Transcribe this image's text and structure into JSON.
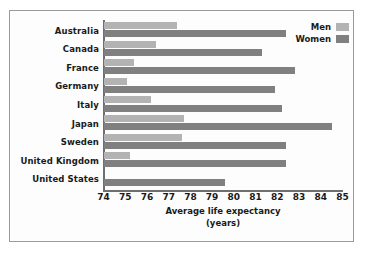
{
  "chart_data": {
    "type": "bar",
    "orientation": "horizontal",
    "title": "",
    "xlabel": "Average life expectancy (years)",
    "xlabel_lines": [
      "Average life expectancy",
      "(years)"
    ],
    "ylabel": "",
    "xlim": [
      74,
      85
    ],
    "xticks": [
      74,
      75,
      76,
      77,
      78,
      79,
      80,
      81,
      82,
      83,
      84,
      85
    ],
    "xtick_labels": [
      "74",
      "75",
      "76",
      "77",
      "78",
      "79",
      "80",
      "81",
      "82",
      "83",
      "84",
      "85"
    ],
    "grid": false,
    "legend_position": "top-right",
    "categories": [
      "Australia",
      "Canada",
      "France",
      "Germany",
      "Italy",
      "Japan",
      "Sweden",
      "United Kingdom",
      "United States"
    ],
    "series": [
      {
        "name": "Men",
        "color": "#b3b3b3",
        "values": [
          77.4,
          76.4,
          75.4,
          75.1,
          76.2,
          77.7,
          77.6,
          75.2,
          74.0
        ]
      },
      {
        "name": "Women",
        "color": "#808080",
        "values": [
          82.4,
          81.3,
          82.8,
          81.9,
          82.2,
          84.5,
          82.4,
          82.4,
          79.6
        ]
      }
    ]
  },
  "legend": {
    "entries": [
      {
        "label": "Men",
        "color": "#b3b3b3"
      },
      {
        "label": "Women",
        "color": "#808080"
      }
    ]
  }
}
